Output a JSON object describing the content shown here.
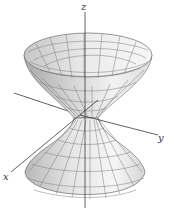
{
  "figure": {
    "axes": {
      "x_label": "x",
      "y_label": "y",
      "z_label": "z"
    },
    "colors": {
      "surface_light": "#f4f4f4",
      "surface_mid": "#d8d8d8",
      "surface_dark": "#a9a9a9",
      "mesh": "#6a6a6a",
      "axis": "#3a3a3a"
    }
  }
}
